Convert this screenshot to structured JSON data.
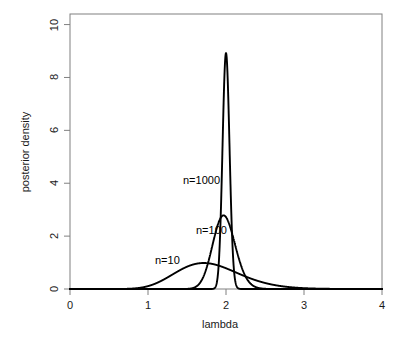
{
  "figure": {
    "width": 404,
    "height": 344,
    "background_color": "#ffffff",
    "plot_box": {
      "left": 70,
      "top": 14,
      "right": 382,
      "bottom": 289
    },
    "box_color": "#808080",
    "curve_color": "#000000",
    "text_color": "#1a1a1a"
  },
  "axes": {
    "x": {
      "title": "lambda",
      "ticks": [
        "0",
        "1",
        "2",
        "3",
        "4"
      ],
      "tick_values": [
        0,
        1,
        2,
        3,
        4
      ],
      "range": [
        0,
        4
      ]
    },
    "y": {
      "title": "posterior density",
      "ticks": [
        "0",
        "2",
        "4",
        "6",
        "8",
        "10"
      ],
      "tick_values": [
        0,
        2,
        4,
        6,
        8,
        10
      ],
      "range": [
        0,
        10.4
      ]
    }
  },
  "annotations": [
    {
      "text": "n=1000",
      "x_px": 183,
      "y_px": 175
    },
    {
      "text": "n=100",
      "x_px": 196,
      "y_px": 225
    },
    {
      "text": "n=10",
      "x_px": 155,
      "y_px": 255
    }
  ],
  "chart_data": {
    "type": "line",
    "title": "",
    "subtitle": "",
    "xlabel": "lambda",
    "ylabel": "posterior density",
    "xlim": [
      0,
      4
    ],
    "ylim": [
      0,
      10.4
    ],
    "grid": false,
    "legend": "none",
    "legend_position": "inline-annotations",
    "x_ticks": [
      0,
      1,
      2,
      3,
      4
    ],
    "y_ticks": [
      0,
      2,
      4,
      6,
      8,
      10
    ],
    "series": [
      {
        "name": "n=10",
        "label": "n=10",
        "color": "#000000",
        "distribution": "gamma",
        "shape": 19.0,
        "rate": 10.5,
        "peak_x": 1.71,
        "peak_y": 1.05,
        "x": [
          0.0,
          0.2,
          0.4,
          0.6,
          0.8,
          1.0,
          1.1,
          1.2,
          1.3,
          1.4,
          1.5,
          1.6,
          1.7,
          1.8,
          1.9,
          2.0,
          2.1,
          2.2,
          2.3,
          2.4,
          2.5,
          2.6,
          2.8,
          3.0,
          3.2,
          3.5,
          4.0
        ],
        "values": [
          0.0,
          0.0,
          0.0,
          0.0,
          0.003,
          0.08,
          0.18,
          0.35,
          0.56,
          0.76,
          0.93,
          1.03,
          1.05,
          1.02,
          0.93,
          0.81,
          0.67,
          0.54,
          0.41,
          0.31,
          0.22,
          0.16,
          0.07,
          0.03,
          0.01,
          0.002,
          0.0
        ]
      },
      {
        "name": "n=100",
        "label": "n=100",
        "color": "#000000",
        "distribution": "gamma",
        "shape": 190.0,
        "rate": 96.0,
        "peak_x": 1.97,
        "peak_y": 2.85,
        "x": [
          0.0,
          0.8,
          1.0,
          1.2,
          1.3,
          1.4,
          1.5,
          1.6,
          1.7,
          1.8,
          1.9,
          1.95,
          2.0,
          2.1,
          2.2,
          2.3,
          2.4,
          2.5,
          2.6,
          2.8,
          3.0,
          3.5,
          4.0
        ],
        "values": [
          0.0,
          0.0,
          0.0,
          0.0,
          0.01,
          0.06,
          0.22,
          0.61,
          1.27,
          2.05,
          2.69,
          2.82,
          2.84,
          2.52,
          1.9,
          1.24,
          0.71,
          0.36,
          0.16,
          0.02,
          0.002,
          0.0,
          0.0
        ]
      },
      {
        "name": "n=1000",
        "label": "n=1000",
        "color": "#000000",
        "distribution": "gamma",
        "shape": 2001.0,
        "rate": 1000.0,
        "peak_x": 2.0,
        "peak_y": 8.95,
        "x": [
          0.0,
          1.5,
          1.7,
          1.75,
          1.8,
          1.85,
          1.9,
          1.93,
          1.96,
          1.98,
          2.0,
          2.02,
          2.04,
          2.07,
          2.1,
          2.15,
          2.2,
          2.25,
          2.3,
          2.4,
          2.6,
          3.0,
          4.0
        ],
        "values": [
          0.0,
          0.0,
          0.0,
          0.001,
          0.03,
          0.25,
          1.35,
          3.1,
          6.05,
          8.1,
          8.95,
          8.1,
          6.05,
          3.1,
          1.35,
          0.25,
          0.03,
          0.004,
          0.0,
          0.0,
          0.0,
          0.0,
          0.0
        ]
      }
    ]
  }
}
